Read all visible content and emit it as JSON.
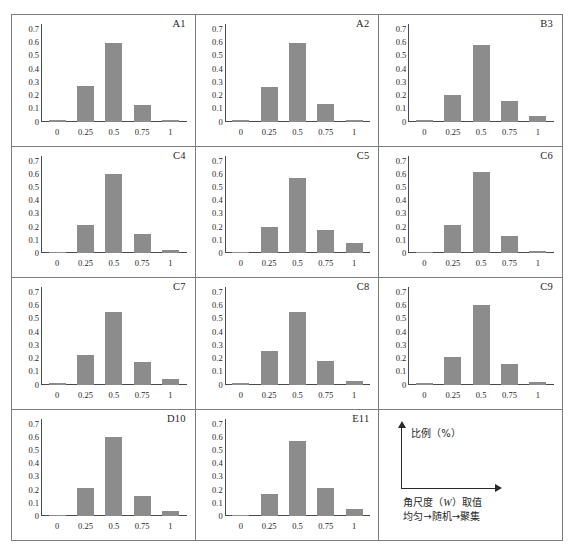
{
  "figure": {
    "bar_color": "#8c8c8c",
    "panel_border_color": "#7d7d7d",
    "axis_color": "#4a4a4a"
  },
  "legend": {
    "y_axis_label": "比例（%）",
    "x_axis_label_line1_prefix": "角尺度（",
    "x_axis_label_line1_symbol": "W",
    "x_axis_label_line1_suffix": "）取值",
    "x_axis_label_line2": "均匀→随机→聚集",
    "y_arrow_icon": "up-arrow-icon",
    "x_arrow_icon": "right-arrow-icon"
  },
  "chart_data": [
    {
      "type": "bar",
      "title": "A1",
      "categories": [
        "0",
        "0.25",
        "0.5",
        "0.75",
        "1"
      ],
      "values": [
        0.005,
        0.27,
        0.595,
        0.125,
        0.005
      ],
      "xlabel": "角尺度（W）取值",
      "ylabel": "比例（%）",
      "ylim": [
        0,
        0.7
      ],
      "yticks": [
        "0",
        "0.1",
        "0.2",
        "0.3",
        "0.4",
        "0.5",
        "0.6",
        "0.7"
      ],
      "grid": false,
      "legend": "none"
    },
    {
      "type": "bar",
      "title": "A2",
      "categories": [
        "0",
        "0.25",
        "0.5",
        "0.75",
        "1"
      ],
      "values": [
        0.005,
        0.26,
        0.595,
        0.13,
        0.005
      ],
      "xlabel": "角尺度（W）取值",
      "ylabel": "比例（%）",
      "ylim": [
        0,
        0.7
      ],
      "yticks": [
        "0",
        "0.1",
        "0.2",
        "0.3",
        "0.4",
        "0.5",
        "0.6",
        "0.7"
      ],
      "grid": false,
      "legend": "none"
    },
    {
      "type": "bar",
      "title": "B3",
      "categories": [
        "0",
        "0.25",
        "0.5",
        "0.75",
        "1"
      ],
      "values": [
        0.008,
        0.2,
        0.58,
        0.155,
        0.04
      ],
      "xlabel": "角尺度（W）取值",
      "ylabel": "比例（%）",
      "ylim": [
        0,
        0.7
      ],
      "yticks": [
        "0",
        "0.1",
        "0.2",
        "0.3",
        "0.4",
        "0.5",
        "0.6",
        "0.7"
      ],
      "grid": false,
      "legend": "none"
    },
    {
      "type": "bar",
      "title": "C4",
      "categories": [
        "0",
        "0.25",
        "0.5",
        "0.75",
        "1"
      ],
      "values": [
        0.0,
        0.21,
        0.6,
        0.145,
        0.025
      ],
      "xlabel": "角尺度（W）取值",
      "ylabel": "比例（%）",
      "ylim": [
        0,
        0.7
      ],
      "yticks": [
        "0",
        "0.1",
        "0.2",
        "0.3",
        "0.4",
        "0.5",
        "0.6",
        "0.7"
      ],
      "grid": false,
      "legend": "none"
    },
    {
      "type": "bar",
      "title": "C5",
      "categories": [
        "0",
        "0.25",
        "0.5",
        "0.75",
        "1"
      ],
      "values": [
        0.0,
        0.195,
        0.565,
        0.175,
        0.075
      ],
      "xlabel": "角尺度（W）取值",
      "ylabel": "比例（%）",
      "ylim": [
        0,
        0.7
      ],
      "yticks": [
        "0",
        "0.1",
        "0.2",
        "0.3",
        "0.4",
        "0.5",
        "0.6",
        "0.7"
      ],
      "grid": false,
      "legend": "none"
    },
    {
      "type": "bar",
      "title": "C6",
      "categories": [
        "0",
        "0.25",
        "0.5",
        "0.75",
        "1"
      ],
      "values": [
        0.005,
        0.215,
        0.615,
        0.13,
        0.015
      ],
      "xlabel": "角尺度（W）取值",
      "ylabel": "比例（%）",
      "ylim": [
        0,
        0.7
      ],
      "yticks": [
        "0",
        "0.1",
        "0.2",
        "0.3",
        "0.4",
        "0.5",
        "0.6",
        "0.7"
      ],
      "grid": false,
      "legend": "none"
    },
    {
      "type": "bar",
      "title": "C7",
      "categories": [
        "0",
        "0.25",
        "0.5",
        "0.75",
        "1"
      ],
      "values": [
        0.0,
        0.22,
        0.545,
        0.17,
        0.045
      ],
      "xlabel": "角尺度（W）取值",
      "ylabel": "比例（%）",
      "ylim": [
        0,
        0.7
      ],
      "yticks": [
        "0",
        "0.1",
        "0.2",
        "0.3",
        "0.4",
        "0.5",
        "0.6",
        "0.7"
      ],
      "grid": false,
      "legend": "none"
    },
    {
      "type": "bar",
      "title": "C8",
      "categories": [
        "0",
        "0.25",
        "0.5",
        "0.75",
        "1"
      ],
      "values": [
        0.005,
        0.25,
        0.545,
        0.175,
        0.025
      ],
      "xlabel": "角尺度（W）取值",
      "ylabel": "比例（%）",
      "ylim": [
        0,
        0.7
      ],
      "yticks": [
        "0",
        "0.1",
        "0.2",
        "0.3",
        "0.4",
        "0.5",
        "0.6",
        "0.7"
      ],
      "grid": false,
      "legend": "none"
    },
    {
      "type": "bar",
      "title": "C9",
      "categories": [
        "0",
        "0.25",
        "0.5",
        "0.75",
        "1"
      ],
      "values": [
        0.0,
        0.21,
        0.6,
        0.155,
        0.02
      ],
      "xlabel": "角尺度（W）取值",
      "ylabel": "比例（%）",
      "ylim": [
        0,
        0.7
      ],
      "yticks": [
        "0",
        "0.1",
        "0.2",
        "0.3",
        "0.4",
        "0.5",
        "0.6",
        "0.7"
      ],
      "grid": false,
      "legend": "none"
    },
    {
      "type": "bar",
      "title": "D10",
      "categories": [
        "0",
        "0.25",
        "0.5",
        "0.75",
        "1"
      ],
      "values": [
        0.0,
        0.21,
        0.595,
        0.155,
        0.04
      ],
      "xlabel": "角尺度（W）取值",
      "ylabel": "比例（%）",
      "ylim": [
        0,
        0.7
      ],
      "yticks": [
        "0",
        "0.1",
        "0.2",
        "0.3",
        "0.4",
        "0.5",
        "0.6",
        "0.7"
      ],
      "grid": false,
      "legend": "none"
    },
    {
      "type": "bar",
      "title": "E11",
      "categories": [
        "0",
        "0.25",
        "0.5",
        "0.75",
        "1"
      ],
      "values": [
        0.0,
        0.17,
        0.565,
        0.21,
        0.055
      ],
      "xlabel": "角尺度（W）取值",
      "ylabel": "比例（%）",
      "ylim": [
        0,
        0.7
      ],
      "yticks": [
        "0",
        "0.1",
        "0.2",
        "0.3",
        "0.4",
        "0.5",
        "0.6",
        "0.7"
      ],
      "grid": false,
      "legend": "none"
    }
  ]
}
